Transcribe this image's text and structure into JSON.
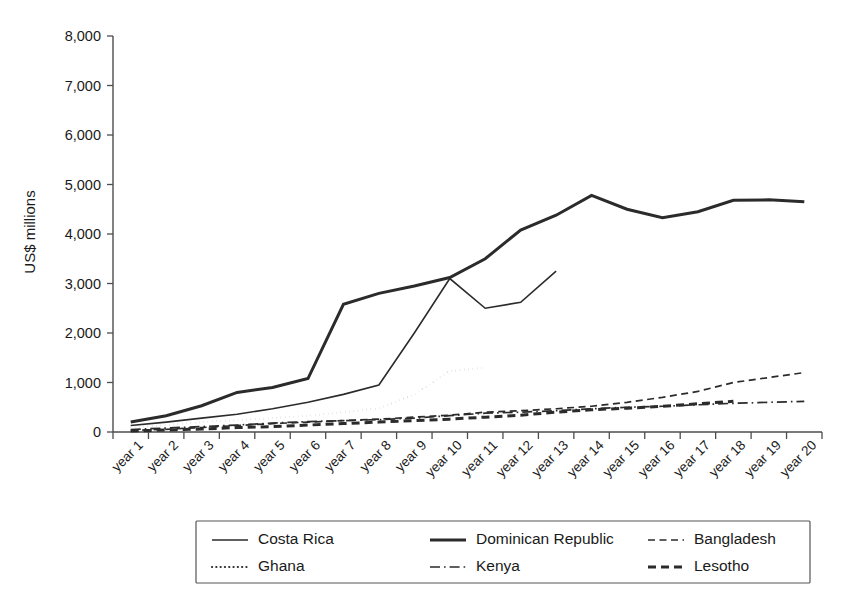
{
  "chart_data": {
    "type": "line",
    "title": "",
    "xlabel": "",
    "ylabel": "US$ millions",
    "ylim": [
      0,
      8000
    ],
    "ytick_values": [
      0,
      1000,
      2000,
      3000,
      4000,
      5000,
      6000,
      7000,
      8000
    ],
    "ytick_labels": [
      "0",
      "1,000",
      "2,000",
      "3,000",
      "4,000",
      "5,000",
      "6,000",
      "7,000",
      "8,000"
    ],
    "grid": false,
    "legend_position": "bottom",
    "categories": [
      "year 1",
      "year 2",
      "year 3",
      "year 4",
      "year 5",
      "year 6",
      "year 7",
      "year 8",
      "year 9",
      "year 10",
      "year 11",
      "year 12",
      "year 13",
      "year 14",
      "year 15",
      "year 16",
      "year 17",
      "year 18",
      "year 19",
      "year 20"
    ],
    "series": [
      {
        "name": "Costa Rica",
        "style": "solid",
        "width": 1.6,
        "values": [
          130,
          200,
          280,
          360,
          470,
          600,
          760,
          950,
          2000,
          3100,
          2500,
          2620,
          3250,
          null,
          null,
          null,
          null,
          null,
          null,
          null
        ]
      },
      {
        "name": "Dominican Republic",
        "style": "solid",
        "width": 3.0,
        "values": [
          200,
          330,
          530,
          800,
          900,
          1080,
          2580,
          2800,
          2950,
          3120,
          3500,
          4080,
          4380,
          4780,
          4500,
          4330,
          4450,
          4680,
          4690,
          4650
        ]
      },
      {
        "name": "Bangladesh",
        "style": "dashed",
        "width": 1.7,
        "values": [
          30,
          55,
          90,
          130,
          170,
          200,
          230,
          260,
          300,
          340,
          400,
          430,
          470,
          520,
          600,
          700,
          820,
          1000,
          1100,
          1200
        ]
      },
      {
        "name": "Ghana",
        "style": "dotted",
        "width": 2.2,
        "values": [
          90,
          140,
          200,
          240,
          280,
          330,
          400,
          480,
          760,
          1230,
          1300,
          null,
          null,
          null,
          null,
          null,
          null,
          null,
          null,
          null
        ]
      },
      {
        "name": "Kenya",
        "style": "dashdot",
        "width": 1.7,
        "values": [
          50,
          80,
          110,
          140,
          180,
          210,
          230,
          250,
          280,
          330,
          380,
          400,
          430,
          470,
          500,
          520,
          550,
          580,
          600,
          620
        ]
      },
      {
        "name": "Lesotho",
        "style": "dashed-bold",
        "width": 3.0,
        "values": [
          20,
          40,
          60,
          90,
          110,
          140,
          170,
          200,
          230,
          260,
          300,
          340,
          400,
          450,
          480,
          520,
          570,
          620,
          null,
          null
        ]
      }
    ],
    "legend_entries": [
      {
        "label": "Costa Rica",
        "style": "solid",
        "width": 1.6
      },
      {
        "label": "Dominican Republic",
        "style": "solid",
        "width": 3.0
      },
      {
        "label": "Bangladesh",
        "style": "dashed",
        "width": 1.7
      },
      {
        "label": "Ghana",
        "style": "dotted",
        "width": 2.2
      },
      {
        "label": "Kenya",
        "style": "dashdot",
        "width": 1.7
      },
      {
        "label": "Lesotho",
        "style": "dashed-bold",
        "width": 3.0
      }
    ],
    "colors": {
      "line": "#2b2b2b",
      "axis": "#4d4d4d",
      "text": "#1a1a1a",
      "background": "#ffffff"
    }
  },
  "caption": {
    "ghost_text": "Figure continues below the visible crop"
  }
}
